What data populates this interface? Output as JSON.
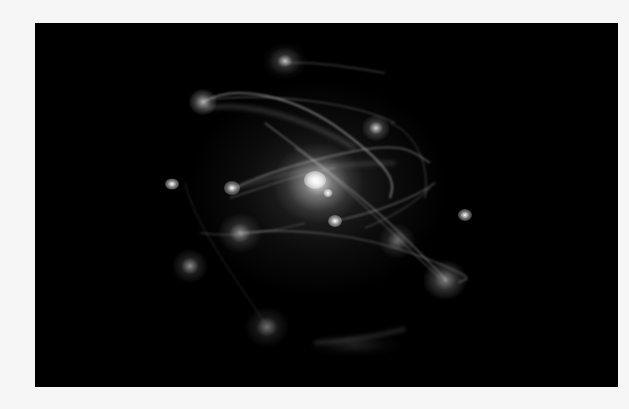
{
  "image": {
    "alt": "Simulated galaxy cluster with glowing central core and orbiting satellite galaxies connected by faint stellar streams",
    "background_color": "#f6f6f6",
    "frame_color": "#000000",
    "frame": {
      "x": 35,
      "y": 23,
      "width": 583,
      "height": 364
    }
  },
  "objects": [
    {
      "name": "central-core",
      "x": 283,
      "y": 160,
      "r": 70,
      "intensity": 1.0
    },
    {
      "name": "core-bright",
      "x": 280,
      "y": 157,
      "r": 14,
      "intensity": 1.0
    },
    {
      "name": "core-secondary",
      "x": 293,
      "y": 170,
      "r": 6,
      "intensity": 0.9
    },
    {
      "name": "satellite-top",
      "x": 250,
      "y": 38,
      "r": 22,
      "intensity": 0.6
    },
    {
      "name": "satellite-upper-left",
      "x": 168,
      "y": 79,
      "r": 14,
      "intensity": 0.7
    },
    {
      "name": "satellite-upper-right",
      "x": 341,
      "y": 105,
      "r": 14,
      "intensity": 0.6
    },
    {
      "name": "satellite-left",
      "x": 137,
      "y": 161,
      "r": 6,
      "intensity": 0.9
    },
    {
      "name": "satellite-inner-left",
      "x": 197,
      "y": 165,
      "r": 8,
      "intensity": 0.8
    },
    {
      "name": "satellite-mid",
      "x": 300,
      "y": 198,
      "r": 7,
      "intensity": 0.9
    },
    {
      "name": "satellite-left-lower",
      "x": 205,
      "y": 210,
      "r": 22,
      "intensity": 0.45
    },
    {
      "name": "satellite-right",
      "x": 430,
      "y": 192,
      "r": 7,
      "intensity": 0.9
    },
    {
      "name": "satellite-right-mid",
      "x": 362,
      "y": 218,
      "r": 18,
      "intensity": 0.4
    },
    {
      "name": "satellite-far-left",
      "x": 155,
      "y": 243,
      "r": 18,
      "intensity": 0.45
    },
    {
      "name": "satellite-lower-right",
      "x": 410,
      "y": 257,
      "r": 22,
      "intensity": 0.55
    },
    {
      "name": "satellite-bottom",
      "x": 232,
      "y": 304,
      "r": 22,
      "intensity": 0.35
    },
    {
      "name": "stream-bottom",
      "x": 320,
      "y": 322,
      "r": 30,
      "intensity": 0.15
    }
  ]
}
